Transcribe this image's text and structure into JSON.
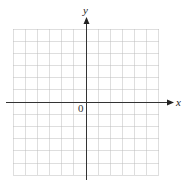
{
  "diagram": {
    "type": "coordinate-plane",
    "x_axis_label": "x",
    "y_axis_label": "y",
    "origin_label": "0",
    "grid": {
      "columns": 12,
      "rows": 12,
      "style": "dotted",
      "color": "#bdbdbd"
    },
    "axis_color": "#333333"
  }
}
